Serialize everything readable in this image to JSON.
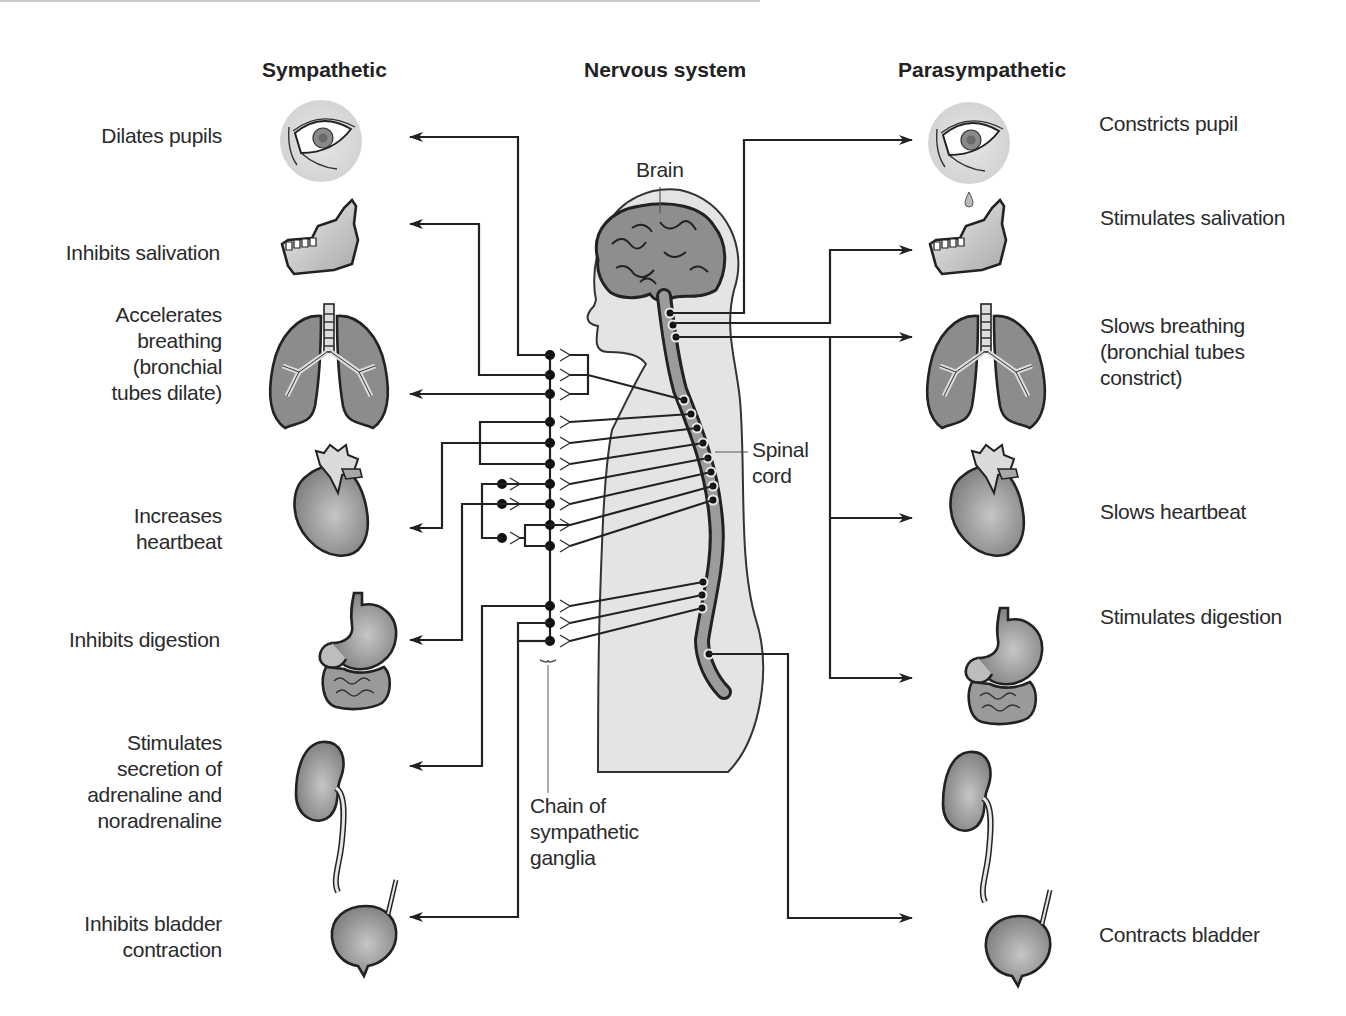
{
  "headers": {
    "sympathetic": "Sympathetic",
    "nervous_system": "Nervous system",
    "parasympathetic": "Parasympathetic"
  },
  "center_labels": {
    "brain": "Brain",
    "spinal_cord": "Spinal\ncord",
    "ganglia_chain": "Chain of\nsympathetic\nganglia"
  },
  "sympathetic_effects": [
    {
      "organ": "eye",
      "label": "Dilates pupils"
    },
    {
      "organ": "jaw",
      "label": "Inhibits salivation"
    },
    {
      "organ": "lungs",
      "label": "Accelerates\nbreathing\n(bronchial\ntubes dilate)"
    },
    {
      "organ": "heart",
      "label": "Increases\nheartbeat"
    },
    {
      "organ": "stomach",
      "label": "Inhibits digestion"
    },
    {
      "organ": "kidney",
      "label": "Stimulates\nsecretion of\nadrenaline and\nnoradrenaline"
    },
    {
      "organ": "bladder",
      "label": "Inhibits bladder\ncontraction"
    }
  ],
  "parasympathetic_effects": [
    {
      "organ": "eye",
      "label": "Constricts pupil"
    },
    {
      "organ": "jaw",
      "label": "Stimulates salivation"
    },
    {
      "organ": "lungs",
      "label": "Slows breathing\n(bronchial tubes\nconstrict)"
    },
    {
      "organ": "heart",
      "label": "Slows heartbeat"
    },
    {
      "organ": "stomach",
      "label": "Stimulates digestion"
    },
    {
      "organ": "bladder",
      "label": "Contracts bladder"
    }
  ],
  "colors": {
    "line": "#222222",
    "organ_fill": "#8f8f8f",
    "body_fill": "#e2e2e2",
    "eye_bg": "#dcdcdc",
    "text": "#2a2a2a"
  }
}
